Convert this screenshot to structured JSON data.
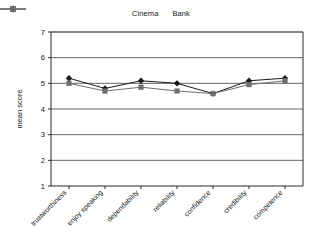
{
  "legend": {
    "position": "top-center",
    "entries": [
      {
        "name": "Cinema",
        "marker": "diamond-marker",
        "color": "#1a1a1a"
      },
      {
        "name": "Bank",
        "marker": "square-marker",
        "color": "#6e6e6e"
      }
    ]
  },
  "chart_data": {
    "type": "line",
    "title": "",
    "subtitle": "",
    "xlabel": "",
    "ylabel": "mean score",
    "ylim": [
      1,
      7
    ],
    "yticks": [
      1,
      2,
      3,
      4,
      5,
      6,
      7
    ],
    "grid": true,
    "legend_position": "top-center",
    "categories": [
      "trustworthiness",
      "enjoy speaking",
      "dependability",
      "reliability",
      "confidence",
      "credibility",
      "competence"
    ],
    "series": [
      {
        "name": "Cinema",
        "marker": "diamond",
        "color": "#1a1a1a",
        "values": [
          5.2,
          4.8,
          5.1,
          5.0,
          4.6,
          5.1,
          5.2
        ]
      },
      {
        "name": "Bank",
        "marker": "square",
        "color": "#6e6e6e",
        "values": [
          5.0,
          4.7,
          4.85,
          4.7,
          4.6,
          4.95,
          5.1
        ]
      }
    ]
  },
  "axes": {
    "y_tick_labels": [
      "7",
      "6",
      "5",
      "4",
      "3",
      "2",
      "1"
    ],
    "y_axis_title": "mean score"
  }
}
